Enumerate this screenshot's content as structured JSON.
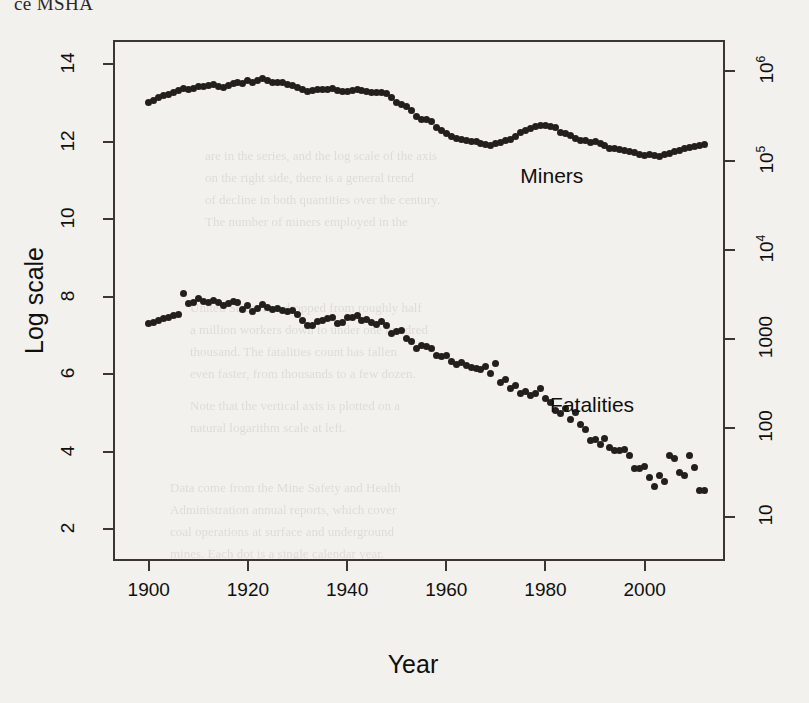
{
  "page": {
    "header_fragment": "ce MSHA",
    "background_note": "scanned book page, faint reverse-side text bleed-through"
  },
  "bleed_text": [
    {
      "t": "are in the series, and the log scale of the axis",
      "x": 205,
      "y": 148
    },
    {
      "t": "on the right side, there is a general trend",
      "x": 205,
      "y": 170
    },
    {
      "t": "of decline in both quantities over the century.",
      "x": 205,
      "y": 192
    },
    {
      "t": "The number of miners employed in the",
      "x": 205,
      "y": 214
    },
    {
      "t": "United States has dropped from roughly half",
      "x": 190,
      "y": 300
    },
    {
      "t": "a million workers down to under one hundred",
      "x": 190,
      "y": 322
    },
    {
      "t": "thousand. The fatalities count has fallen",
      "x": 190,
      "y": 344
    },
    {
      "t": "even faster, from thousands to a few dozen.",
      "x": 190,
      "y": 366
    },
    {
      "t": "Note that the vertical axis is plotted on a",
      "x": 190,
      "y": 398
    },
    {
      "t": "natural logarithm scale at left.",
      "x": 190,
      "y": 420
    },
    {
      "t": "Data come from the Mine Safety and Health",
      "x": 170,
      "y": 480
    },
    {
      "t": "Administration annual reports, which cover",
      "x": 170,
      "y": 502
    },
    {
      "t": "coal operations at surface and underground",
      "x": 170,
      "y": 524
    },
    {
      "t": "mines. Each dot is a single calendar year.",
      "x": 170,
      "y": 546
    }
  ],
  "chart_data": {
    "type": "scatter",
    "title": "",
    "xlabel": "Year",
    "ylabel": "Log scale",
    "xlim": [
      1893,
      2016
    ],
    "ylim": [
      1.2,
      14.6
    ],
    "grid": false,
    "legend": "inline-annotation",
    "xticks": [
      1900,
      1920,
      1940,
      1960,
      1980,
      2000
    ],
    "yticks_left": [
      2,
      4,
      6,
      8,
      10,
      12,
      14
    ],
    "yticks_right_values": [
      2.303,
      4.605,
      6.908,
      9.21,
      11.513,
      13.816
    ],
    "yticks_right_labels": [
      "10",
      "100",
      "1000",
      "10⁴",
      "10⁵",
      "10⁶"
    ],
    "annotations": [
      {
        "text": "Miners",
        "x": 1983,
        "y": 11.05
      },
      {
        "text": "Fatalities",
        "x": 1989,
        "y": 5.15
      }
    ],
    "series": [
      {
        "name": "Miners",
        "note": "natural log of number of coal miners employed",
        "x": [
          1900,
          1901,
          1902,
          1903,
          1904,
          1905,
          1906,
          1907,
          1908,
          1909,
          1910,
          1911,
          1912,
          1913,
          1914,
          1915,
          1916,
          1917,
          1918,
          1919,
          1920,
          1921,
          1922,
          1923,
          1924,
          1925,
          1926,
          1927,
          1928,
          1929,
          1930,
          1931,
          1932,
          1933,
          1934,
          1935,
          1936,
          1937,
          1938,
          1939,
          1940,
          1941,
          1942,
          1943,
          1944,
          1945,
          1946,
          1947,
          1948,
          1949,
          1950,
          1951,
          1952,
          1953,
          1954,
          1955,
          1956,
          1957,
          1958,
          1959,
          1960,
          1961,
          1962,
          1963,
          1964,
          1965,
          1966,
          1967,
          1968,
          1969,
          1970,
          1971,
          1972,
          1973,
          1974,
          1975,
          1976,
          1977,
          1978,
          1979,
          1980,
          1981,
          1982,
          1983,
          1984,
          1985,
          1986,
          1987,
          1988,
          1989,
          1990,
          1991,
          1992,
          1993,
          1994,
          1995,
          1996,
          1997,
          1998,
          1999,
          2000,
          2001,
          2002,
          2003,
          2004,
          2005,
          2006,
          2007,
          2008,
          2009,
          2010,
          2011,
          2012
        ],
        "y": [
          13.0,
          13.07,
          13.13,
          13.2,
          13.22,
          13.27,
          13.32,
          13.38,
          13.36,
          13.38,
          13.42,
          13.42,
          13.44,
          13.47,
          13.43,
          13.41,
          13.44,
          13.5,
          13.53,
          13.5,
          13.58,
          13.54,
          13.57,
          13.64,
          13.58,
          13.52,
          13.54,
          13.52,
          13.47,
          13.44,
          13.4,
          13.34,
          13.3,
          13.31,
          13.35,
          13.35,
          13.36,
          13.38,
          13.31,
          13.29,
          13.3,
          13.33,
          13.34,
          13.33,
          13.3,
          13.26,
          13.28,
          13.28,
          13.25,
          13.13,
          13.02,
          12.97,
          12.9,
          12.81,
          12.64,
          12.58,
          12.57,
          12.53,
          12.37,
          12.28,
          12.22,
          12.14,
          12.09,
          12.05,
          12.03,
          12.01,
          12.0,
          11.96,
          11.94,
          11.9,
          11.96,
          11.98,
          12.03,
          12.06,
          12.13,
          12.25,
          12.3,
          12.33,
          12.38,
          12.41,
          12.43,
          12.39,
          12.36,
          12.25,
          12.21,
          12.16,
          12.07,
          12.03,
          12.02,
          11.99,
          12.0,
          11.95,
          11.89,
          11.82,
          11.83,
          11.8,
          11.76,
          11.74,
          11.72,
          11.66,
          11.65,
          11.67,
          11.64,
          11.63,
          11.66,
          11.7,
          11.75,
          11.78,
          11.83,
          11.86,
          11.87,
          11.9,
          11.92
        ]
      },
      {
        "name": "Fatalities",
        "note": "natural log of number of coal mining fatalities",
        "x": [
          1900,
          1901,
          1902,
          1903,
          1904,
          1905,
          1906,
          1907,
          1908,
          1909,
          1910,
          1911,
          1912,
          1913,
          1914,
          1915,
          1916,
          1917,
          1918,
          1919,
          1920,
          1921,
          1922,
          1923,
          1924,
          1925,
          1926,
          1927,
          1928,
          1929,
          1930,
          1931,
          1932,
          1933,
          1934,
          1935,
          1936,
          1937,
          1938,
          1939,
          1940,
          1941,
          1942,
          1943,
          1944,
          1945,
          1946,
          1947,
          1948,
          1949,
          1950,
          1951,
          1952,
          1953,
          1954,
          1955,
          1956,
          1957,
          1958,
          1959,
          1960,
          1961,
          1962,
          1963,
          1964,
          1965,
          1966,
          1967,
          1968,
          1969,
          1970,
          1971,
          1972,
          1973,
          1974,
          1975,
          1976,
          1977,
          1978,
          1979,
          1980,
          1981,
          1982,
          1983,
          1984,
          1985,
          1986,
          1987,
          1988,
          1989,
          1990,
          1991,
          1992,
          1993,
          1994,
          1995,
          1996,
          1997,
          1998,
          1999,
          2000,
          2001,
          2002,
          2003,
          2004,
          2005,
          2006,
          2007,
          2008,
          2009,
          2010,
          2011,
          2012
        ],
        "y": [
          7.31,
          7.34,
          7.38,
          7.44,
          7.47,
          7.51,
          7.55,
          8.08,
          7.82,
          7.85,
          7.95,
          7.88,
          7.84,
          7.9,
          7.84,
          7.76,
          7.82,
          7.88,
          7.85,
          7.68,
          7.78,
          7.62,
          7.7,
          7.8,
          7.73,
          7.67,
          7.7,
          7.65,
          7.62,
          7.63,
          7.55,
          7.39,
          7.25,
          7.26,
          7.37,
          7.38,
          7.43,
          7.47,
          7.3,
          7.32,
          7.45,
          7.47,
          7.52,
          7.39,
          7.41,
          7.34,
          7.28,
          7.35,
          7.26,
          7.06,
          7.1,
          7.13,
          6.93,
          6.83,
          6.65,
          6.73,
          6.7,
          6.66,
          6.49,
          6.46,
          6.48,
          6.33,
          6.26,
          6.29,
          6.21,
          6.17,
          6.14,
          6.11,
          6.2,
          6.02,
          6.27,
          5.79,
          5.85,
          5.62,
          5.7,
          5.5,
          5.55,
          5.45,
          5.49,
          5.64,
          5.36,
          5.27,
          5.05,
          4.97,
          5.11,
          4.82,
          5.0,
          4.69,
          4.57,
          4.28,
          4.32,
          4.19,
          4.34,
          4.11,
          4.04,
          4.02,
          4.06,
          3.91,
          3.56,
          3.56,
          3.61,
          3.33,
          3.09,
          3.37,
          3.22,
          3.91,
          3.83,
          3.47,
          3.37,
          3.91,
          3.58,
          3.0,
          3.0
        ]
      }
    ]
  }
}
